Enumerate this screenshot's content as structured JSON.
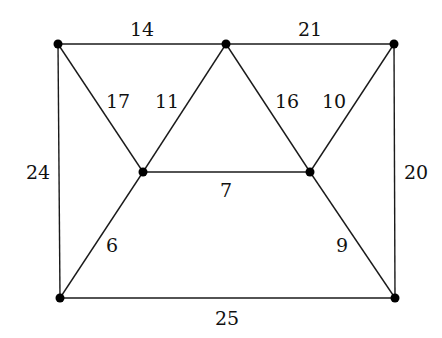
{
  "graph": {
    "nodes": [
      {
        "id": "A",
        "x": 58,
        "y": 44
      },
      {
        "id": "B",
        "x": 226,
        "y": 44
      },
      {
        "id": "C",
        "x": 394,
        "y": 44
      },
      {
        "id": "D",
        "x": 143,
        "y": 172
      },
      {
        "id": "E",
        "x": 310,
        "y": 172
      },
      {
        "id": "F",
        "x": 60,
        "y": 298
      },
      {
        "id": "G",
        "x": 395,
        "y": 298
      }
    ],
    "edges": [
      {
        "from": "A",
        "to": "B",
        "weight": "14",
        "lx": 142,
        "ly": 29
      },
      {
        "from": "B",
        "to": "C",
        "weight": "21",
        "lx": 310,
        "ly": 29
      },
      {
        "from": "A",
        "to": "D",
        "weight": "17",
        "lx": 118,
        "ly": 101
      },
      {
        "from": "B",
        "to": "D",
        "weight": "11",
        "lx": 167,
        "ly": 101
      },
      {
        "from": "B",
        "to": "E",
        "weight": "16",
        "lx": 287,
        "ly": 101
      },
      {
        "from": "C",
        "to": "E",
        "weight": "10",
        "lx": 334,
        "ly": 101
      },
      {
        "from": "A",
        "to": "F",
        "weight": "24",
        "lx": 38,
        "ly": 172
      },
      {
        "from": "C",
        "to": "G",
        "weight": "20",
        "lx": 416,
        "ly": 172
      },
      {
        "from": "D",
        "to": "E",
        "weight": "7",
        "lx": 226,
        "ly": 190
      },
      {
        "from": "D",
        "to": "F",
        "weight": "6",
        "lx": 112,
        "ly": 245
      },
      {
        "from": "E",
        "to": "G",
        "weight": "9",
        "lx": 342,
        "ly": 245
      },
      {
        "from": "F",
        "to": "G",
        "weight": "25",
        "lx": 227,
        "ly": 318
      }
    ]
  },
  "colors": {
    "edge": "#1a1a1a",
    "node": "#000000",
    "background": "#ffffff"
  }
}
